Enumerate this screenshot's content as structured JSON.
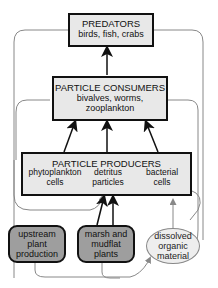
{
  "diagram": {
    "predators": {
      "title": "PREDATORS",
      "subtitle": "birds, fish, crabs"
    },
    "consumers": {
      "title": "PARTICLE CONSUMERS",
      "line1": "bivalves, worms,",
      "line2": "zooplankton"
    },
    "producers": {
      "title": "PARTICLE PRODUCERS",
      "phyto": {
        "line1": "phytoplankton",
        "line2": "cells"
      },
      "detritus": {
        "line1": "detritus",
        "line2": "particles"
      },
      "bacterial": {
        "line1": "bacterial",
        "line2": "cells"
      }
    },
    "upstream": {
      "line1": "upstream",
      "line2": "plant",
      "line3": "production"
    },
    "marsh": {
      "line1": "marsh and",
      "line2": "mudflat",
      "line3": "plants"
    },
    "dissolved": {
      "line1": "dissolved",
      "line2": "organic",
      "line3": "material"
    },
    "colors": {
      "box_fill": "#e8e8e8",
      "plant_fill": "#9e9e9e",
      "dom_fill": "#eeeeee",
      "line": "#111111",
      "gray_line": "#888888"
    }
  }
}
